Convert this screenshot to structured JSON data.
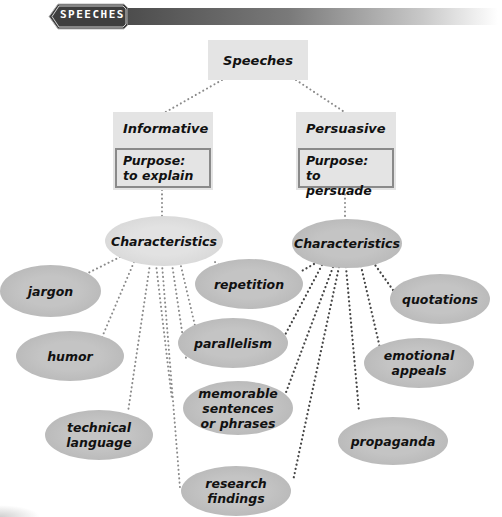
{
  "banner": {
    "label": "SPEECHES"
  },
  "root": {
    "label": "Speeches"
  },
  "branches": [
    {
      "title": "Informative",
      "purpose": "Purpose: to explain",
      "characteristics_label": "Characteristics"
    },
    {
      "title": "Persuasive",
      "purpose": "Purpose: to persuade",
      "characteristics_label": "Characteristics"
    }
  ],
  "characteristics": {
    "informative_only": [
      "jargon",
      "humor",
      "technical language"
    ],
    "shared": [
      "repetition",
      "parallelism",
      "memorable sentences or phrases",
      "research findings"
    ],
    "persuasive_only": [
      "quotations",
      "emotional appeals",
      "propaganda"
    ]
  },
  "nodes": {
    "jargon": "jargon",
    "humor": "humor",
    "technical": "technical language",
    "repetition": "repetition",
    "parallelism": "parallelism",
    "memorable": "memorable sentences or phrases",
    "research": "research findings",
    "quotations": "quotations",
    "emotional": "emotional appeals",
    "propaganda": "propaganda"
  },
  "colors": {
    "box_fill": "#e4e4e4",
    "box_border": "#8a8a8a",
    "ellipse_light": "#dcdcdc",
    "ellipse_dark": "#bdbdbd",
    "connector": "#555555",
    "banner_dark": "#4a4a4a"
  }
}
